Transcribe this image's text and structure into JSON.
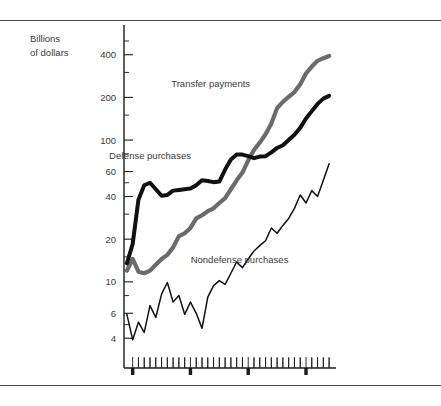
{
  "figure": {
    "axis_title_line1": "Billions",
    "axis_title_line2": "of dollars"
  },
  "chart_data": {
    "type": "line",
    "title": "",
    "xlabel": "",
    "ylabel": "Billions of dollars",
    "yscale": "log",
    "ylim": [
      3.2,
      560
    ],
    "xlim": [
      1948.5,
      1984.5
    ],
    "grid": false,
    "legend": "inline-annotations",
    "ytick_labels": [
      "400",
      "200",
      "100",
      "60",
      "40",
      "20",
      "10",
      "6",
      "4"
    ],
    "yticks": [
      400,
      200,
      100,
      60,
      40,
      20,
      10,
      6,
      4
    ],
    "ytick_minor": [
      500,
      300,
      150,
      80,
      50,
      30,
      15,
      8,
      5
    ],
    "xtick_labels": [
      "1950",
      "1960",
      "1970",
      "1980",
      "1984"
    ],
    "xticks": [
      1950,
      1960,
      1970,
      1980,
      1984
    ],
    "xtick_minor_step": 1,
    "annotations": [
      {
        "text": "Transfer payments",
        "x": 1963.5,
        "y": 235
      },
      {
        "text": "Defense purchases",
        "x": 1953.0,
        "y": 74
      },
      {
        "text": "Nondefense purchases",
        "x": 1968.5,
        "y": 13.5
      }
    ],
    "series": [
      {
        "name": "Transfer payments",
        "color": "#6b6b6b",
        "style": "thick",
        "x": [
          1949,
          1950,
          1951,
          1952,
          1953,
          1954,
          1955,
          1956,
          1957,
          1958,
          1959,
          1960,
          1961,
          1962,
          1963,
          1964,
          1965,
          1966,
          1967,
          1968,
          1969,
          1970,
          1971,
          1972,
          1973,
          1974,
          1975,
          1976,
          1977,
          1978,
          1979,
          1980,
          1981,
          1982,
          1983,
          1984
        ],
        "values": [
          12.0,
          14.5,
          11.8,
          11.5,
          12.0,
          13.2,
          14.5,
          15.5,
          17.5,
          21.0,
          22.0,
          24.0,
          28.0,
          29.5,
          31.5,
          33.0,
          36.0,
          39.0,
          45.0,
          52.0,
          59.0,
          72.0,
          85.0,
          96.0,
          110.0,
          131.0,
          168.0,
          186.0,
          202.0,
          218.0,
          248.0,
          295.0,
          330.0,
          362.0,
          378.0,
          392.0
        ]
      },
      {
        "name": "Defense purchases",
        "color": "#111111",
        "style": "thick",
        "x": [
          1949,
          1950,
          1951,
          1952,
          1953,
          1954,
          1955,
          1956,
          1957,
          1958,
          1959,
          1960,
          1961,
          1962,
          1963,
          1964,
          1965,
          1966,
          1967,
          1968,
          1969,
          1970,
          1971,
          1972,
          1973,
          1974,
          1975,
          1976,
          1977,
          1978,
          1979,
          1980,
          1981,
          1982,
          1983,
          1984
        ],
        "values": [
          13.5,
          18.5,
          38.0,
          48.0,
          50.0,
          45.0,
          40.5,
          41.0,
          44.0,
          44.5,
          45.0,
          45.5,
          48.0,
          52.0,
          51.5,
          50.5,
          51.0,
          62.0,
          73.0,
          79.0,
          79.0,
          77.0,
          74.5,
          76.5,
          77.0,
          82.0,
          88.0,
          92.0,
          100.0,
          109.0,
          122.0,
          142.0,
          160.0,
          180.0,
          196.0,
          205.0
        ]
      },
      {
        "name": "Nondefense purchases",
        "color": "#111111",
        "style": "thin",
        "x": [
          1949,
          1950,
          1951,
          1952,
          1953,
          1954,
          1955,
          1956,
          1957,
          1958,
          1959,
          1960,
          1961,
          1962,
          1963,
          1964,
          1965,
          1966,
          1967,
          1968,
          1969,
          1970,
          1971,
          1972,
          1973,
          1974,
          1975,
          1976,
          1977,
          1978,
          1979,
          1980,
          1981,
          1982,
          1983,
          1984
        ],
        "values": [
          5.9,
          3.9,
          5.2,
          4.4,
          6.8,
          5.6,
          8.2,
          9.9,
          7.2,
          8.0,
          5.9,
          7.2,
          6.0,
          4.7,
          7.8,
          9.4,
          10.2,
          9.6,
          11.5,
          13.8,
          12.6,
          14.5,
          16.5,
          18.0,
          19.5,
          24.0,
          22.0,
          25.0,
          28.0,
          33.0,
          41.0,
          36.0,
          44.0,
          40.0,
          52.0,
          68.0
        ]
      }
    ]
  }
}
